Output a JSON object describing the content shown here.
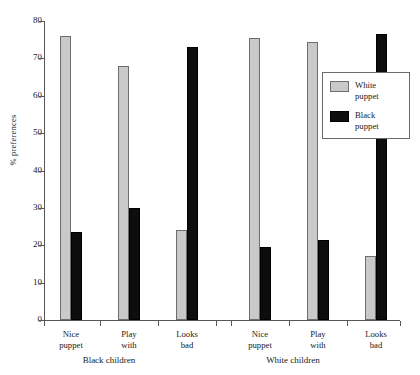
{
  "chart_data": {
    "type": "bar",
    "title": "",
    "xlabel": "",
    "ylabel": "% preferences",
    "ylim": [
      0,
      80
    ],
    "ytick_step": 10,
    "yticks": [
      80,
      70,
      60,
      50,
      40,
      30,
      20,
      10,
      0
    ],
    "grid": false,
    "legend_position": "right-inside",
    "groups": [
      {
        "label": "Black children",
        "categories": [
          "Nice\npuppet",
          "Play\nwith",
          "Looks\nbad"
        ]
      },
      {
        "label": "White children",
        "categories": [
          "Nice\npuppet",
          "Play\nwith",
          "Looks\nbad"
        ]
      }
    ],
    "categories": [
      "Nice puppet",
      "Play with",
      "Looks bad",
      "Nice puppet",
      "Play with",
      "Looks bad"
    ],
    "series": [
      {
        "name": "White puppet",
        "color": "#c9c9c9",
        "values": [
          76,
          68,
          24,
          75.5,
          74.5,
          17
        ]
      },
      {
        "name": "Black puppet",
        "color": "#0d0d0d",
        "values": [
          23.5,
          30,
          73,
          19.5,
          21.5,
          76.5
        ]
      }
    ],
    "legend": [
      {
        "label": "White\npuppet",
        "color": "#c9c9c9"
      },
      {
        "label": "Black\npuppet",
        "color": "#0d0d0d"
      }
    ]
  },
  "axis": {
    "y_label": "% preferences",
    "y_ticks": [
      "80",
      "70",
      "60",
      "50",
      "40",
      "30",
      "20",
      "10",
      "0"
    ]
  },
  "x_labels": {
    "g0c0": "Nice\npuppet",
    "g0c1": "Play\nwith",
    "g0c2": "Looks\nbad",
    "g1c0": "Nice\npuppet",
    "g1c1": "Play\nwith",
    "g1c2": "Looks\nbad"
  },
  "group_labels": {
    "black_children": "Black children",
    "white_children": "White children"
  },
  "legend": {
    "white_puppet": "White\npuppet",
    "black_puppet": "Black\npuppet"
  }
}
